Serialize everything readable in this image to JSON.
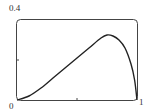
{
  "chart_data": {
    "type": "line",
    "title": "",
    "xlabel": "",
    "ylabel": "",
    "xlim": [
      0,
      1
    ],
    "ylim": [
      0,
      0.4
    ],
    "x_ticks": [
      "0",
      "1"
    ],
    "y_ticks": [
      "0.4"
    ],
    "origin_label": "0",
    "grid": false,
    "legend": null,
    "series": [
      {
        "name": "curve",
        "x": [
          0,
          0.1,
          0.2,
          0.3,
          0.4,
          0.5,
          0.6,
          0.7,
          0.75,
          0.8,
          0.85,
          0.9,
          0.95,
          0.98,
          1.0
        ],
        "y": [
          0,
          0.02,
          0.06,
          0.11,
          0.16,
          0.21,
          0.26,
          0.31,
          0.325,
          0.32,
          0.3,
          0.26,
          0.18,
          0.1,
          0
        ]
      }
    ]
  },
  "labels": {
    "y_top": "0.4",
    "x_origin": "0",
    "x_end": "1"
  }
}
